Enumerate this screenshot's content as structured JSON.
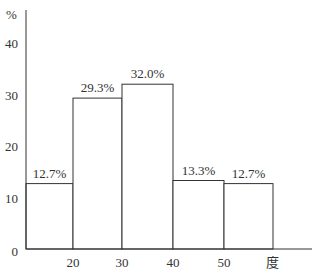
{
  "chart_data": {
    "type": "bar",
    "subtype": "histogram",
    "title": "",
    "xlabel": "度",
    "ylabel": "%",
    "bins": [
      [
        10,
        20
      ],
      [
        20,
        30
      ],
      [
        30,
        40
      ],
      [
        40,
        50
      ],
      [
        50,
        60
      ]
    ],
    "categories": [
      "10-20",
      "20-30",
      "30-40",
      "40-50",
      "50-60"
    ],
    "values": [
      12.7,
      29.3,
      32.0,
      13.3,
      12.7
    ],
    "data_labels": [
      "12.7%",
      "29.3%",
      "32.0%",
      "13.3%",
      "12.7%"
    ],
    "x_ticks": [
      "20",
      "30",
      "40",
      "50"
    ],
    "y_ticks": [
      "0",
      "10",
      "20",
      "30",
      "40"
    ],
    "ylim": [
      0,
      45
    ],
    "grid": false,
    "legend": null
  },
  "axis": {
    "y_unit": "%",
    "x_unit": "度"
  }
}
